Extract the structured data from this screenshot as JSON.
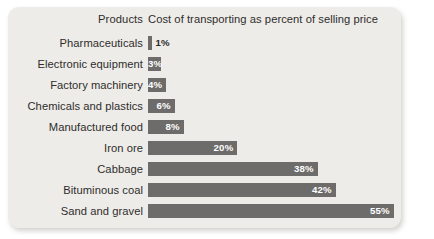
{
  "card": {
    "background_color": "#edece9",
    "bar_color": "#6d6c6a",
    "text_color": "#2f2d2b"
  },
  "header": {
    "products_label": "Products",
    "cost_label": "Cost of transporting as percent of selling price"
  },
  "chart_data": {
    "type": "bar",
    "orientation": "horizontal",
    "title": "",
    "xlabel": "Cost of transporting as percent of selling price",
    "ylabel": "Products",
    "xlim": [
      0,
      55
    ],
    "grid": false,
    "legend": false,
    "categories": [
      "Pharmaceuticals",
      "Electronic equipment",
      "Factory machinery",
      "Chemicals and plastics",
      "Manufactured food",
      "Iron ore",
      "Cabbage",
      "Bituminous coal",
      "Sand and gravel"
    ],
    "values": [
      1,
      3,
      4,
      6,
      8,
      20,
      38,
      42,
      55
    ],
    "data_labels": [
      "1%",
      "3%",
      "4%",
      "6%",
      "8%",
      "20%",
      "38%",
      "42%",
      "55%"
    ],
    "label_placement": [
      "outside",
      "inside",
      "inside",
      "inside",
      "inside",
      "inside",
      "inside",
      "inside",
      "inside"
    ]
  }
}
